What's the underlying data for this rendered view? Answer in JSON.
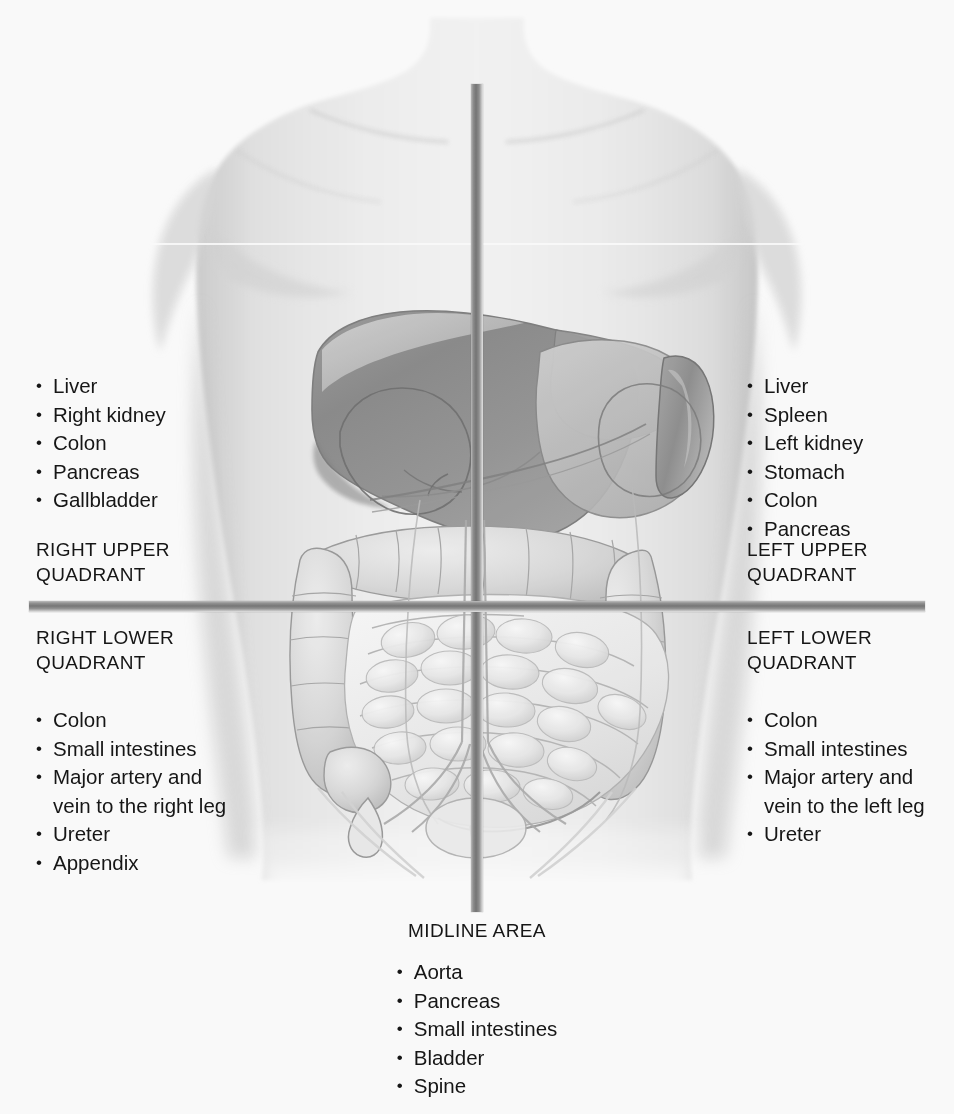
{
  "diagram": {
    "illustration_name": "human-torso-abdominal-organs",
    "colors": {
      "divider": "#767676",
      "text": "#161616",
      "background": "#ffffff",
      "liver": "#8e8e8e",
      "skin": "#e9e9e9"
    }
  },
  "right_upper_quadrant": {
    "heading": "RIGHT UPPER\nQUADRANT",
    "organs": [
      "Liver",
      "Right kidney",
      "Colon",
      "Pancreas",
      "Gallbladder"
    ]
  },
  "left_upper_quadrant": {
    "heading": "LEFT UPPER\nQUADRANT",
    "organs": [
      "Liver",
      "Spleen",
      "Left kidney",
      "Stomach",
      "Colon",
      "Pancreas"
    ]
  },
  "right_lower_quadrant": {
    "heading": "RIGHT LOWER\nQUADRANT",
    "organs": [
      "Colon",
      "Small intestines",
      "Major artery and\nvein to the right leg",
      "Ureter",
      "Appendix"
    ]
  },
  "left_lower_quadrant": {
    "heading": "LEFT LOWER\nQUADRANT",
    "organs": [
      "Colon",
      "Small intestines",
      "Major artery and\nvein to the left leg",
      "Ureter"
    ]
  },
  "midline_area": {
    "heading": "MIDLINE AREA",
    "organs": [
      "Aorta",
      "Pancreas",
      "Small intestines",
      "Bladder",
      "Spine"
    ]
  }
}
